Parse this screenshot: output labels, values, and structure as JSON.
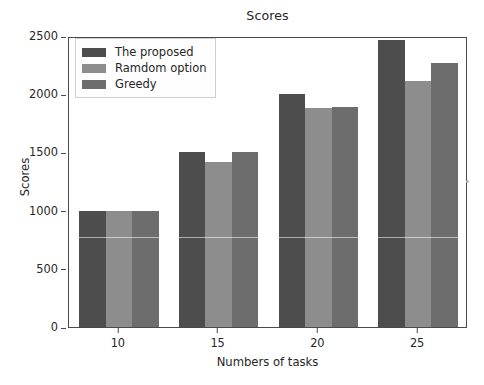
{
  "figure": {
    "background_color": "#ffffff",
    "axes_edge_color": "#4a4a4a",
    "text_color": "#262626"
  },
  "legend": {
    "position": "upper left",
    "entries": [
      {
        "label": "The proposed",
        "color": "#4d4d4d"
      },
      {
        "label": "Ramdom option",
        "color": "#8d8d8d"
      },
      {
        "label": "Greedy",
        "color": "#6d6d6d"
      }
    ]
  },
  "chart_data": {
    "type": "bar",
    "title": "Scores",
    "xlabel": "Numbers of tasks",
    "ylabel": "Scores",
    "categories": [
      "10",
      "15",
      "20",
      "25"
    ],
    "series": [
      {
        "name": "The proposed",
        "color": "#4d4d4d",
        "values": [
          1000,
          1500,
          2000,
          2470
        ]
      },
      {
        "name": "Ramdom option",
        "color": "#8d8d8d",
        "values": [
          1000,
          1420,
          1880,
          2110
        ]
      },
      {
        "name": "Greedy",
        "color": "#6d6d6d",
        "values": [
          1000,
          1500,
          1890,
          2265
        ]
      }
    ],
    "ylim": [
      0,
      2500
    ],
    "yticks": [
      0,
      500,
      1000,
      1500,
      2000,
      2500
    ],
    "ytick_labels": [
      "0",
      "500",
      "1000",
      "1500",
      "2000",
      "2500"
    ],
    "xtick_labels": [
      "10",
      "15",
      "20",
      "25"
    ],
    "grid": false,
    "legend_position": "upper left"
  }
}
